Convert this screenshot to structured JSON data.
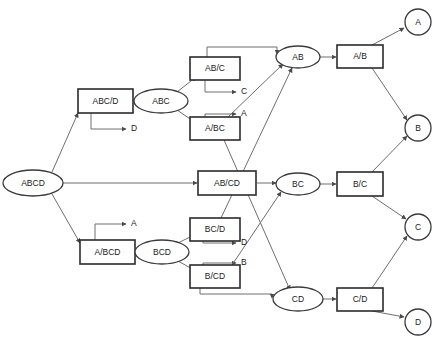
{
  "diagram": {
    "canvas": {
      "width": 442,
      "height": 341,
      "background": "#ffffff"
    },
    "colors": {
      "box_stroke": "#2b2b2b",
      "ellipse_stroke": "#3a3a3a",
      "circle_stroke": "#3a3a3a",
      "edge": "#6e6e6e",
      "text": "#1a1a1a",
      "fill": "#ffffff"
    },
    "nodes": {
      "root": {
        "label": "ABCD",
        "shape": "ellipse",
        "x": 33,
        "y": 183
      },
      "abc_d": {
        "label": "ABC/D",
        "shape": "box",
        "x": 105,
        "y": 101
      },
      "abc": {
        "label": "ABC",
        "shape": "ellipse",
        "x": 160,
        "y": 101
      },
      "ab_c": {
        "label": "AB/C",
        "shape": "box",
        "x": 215,
        "y": 69
      },
      "a_bc": {
        "label": "A/BC",
        "shape": "box",
        "x": 215,
        "y": 128
      },
      "ab": {
        "label": "AB",
        "shape": "ellipse",
        "x": 298,
        "y": 57
      },
      "a_b": {
        "label": "A/B",
        "shape": "box",
        "x": 360,
        "y": 56
      },
      "ab_cd": {
        "label": "AB/CD",
        "shape": "box",
        "x": 227,
        "y": 183
      },
      "bc": {
        "label": "BC",
        "shape": "ellipse",
        "x": 298,
        "y": 184
      },
      "b_c": {
        "label": "B/C",
        "shape": "box",
        "x": 360,
        "y": 184
      },
      "a_bcd": {
        "label": "A/BCD",
        "shape": "box",
        "x": 107,
        "y": 252
      },
      "bcd": {
        "label": "BCD",
        "shape": "ellipse",
        "x": 162,
        "y": 252
      },
      "bc_d": {
        "label": "BC/D",
        "shape": "box",
        "x": 215,
        "y": 229
      },
      "b_cd": {
        "label": "B/CD",
        "shape": "box",
        "x": 215,
        "y": 276
      },
      "cd": {
        "label": "CD",
        "shape": "ellipse",
        "x": 298,
        "y": 299
      },
      "c_d": {
        "label": "C/D",
        "shape": "box",
        "x": 360,
        "y": 299
      },
      "leaf_a": {
        "label": "A",
        "shape": "circle",
        "x": 418,
        "y": 22
      },
      "leaf_b": {
        "label": "B",
        "shape": "circle",
        "x": 418,
        "y": 128
      },
      "leaf_c": {
        "label": "C",
        "shape": "circle",
        "x": 418,
        "y": 227
      },
      "leaf_d": {
        "label": "D",
        "shape": "circle",
        "x": 418,
        "y": 322
      }
    },
    "output_labels": [
      {
        "id": "out-d-top",
        "text": "D",
        "x": 134,
        "y": 129
      },
      {
        "id": "out-c",
        "text": "C",
        "x": 244,
        "y": 92
      },
      {
        "id": "out-a-mid",
        "text": "A",
        "x": 244,
        "y": 114
      },
      {
        "id": "out-a-low",
        "text": "A",
        "x": 134,
        "y": 224
      },
      {
        "id": "out-d-low",
        "text": "D",
        "x": 244,
        "y": 243
      },
      {
        "id": "out-b-low",
        "text": "B",
        "x": 244,
        "y": 263
      }
    ],
    "edges": [
      {
        "from": "root",
        "to": "abc_d"
      },
      {
        "from": "root",
        "to": "ab_cd"
      },
      {
        "from": "root",
        "to": "a_bcd"
      },
      {
        "from": "abc_d",
        "to": "abc"
      },
      {
        "from": "abc_d",
        "to": "out-d-top"
      },
      {
        "from": "abc",
        "to": "ab_c"
      },
      {
        "from": "abc",
        "to": "a_bc"
      },
      {
        "from": "ab_c",
        "to": "ab"
      },
      {
        "from": "ab_c",
        "to": "out-c"
      },
      {
        "from": "a_bc",
        "to": "out-a-mid"
      },
      {
        "from": "a_bc",
        "to": "ab"
      },
      {
        "from": "a_bc",
        "to": "cd"
      },
      {
        "from": "ab",
        "to": "a_b"
      },
      {
        "from": "a_b",
        "to": "leaf_a"
      },
      {
        "from": "a_b",
        "to": "leaf_b"
      },
      {
        "from": "ab_cd",
        "to": "bc"
      },
      {
        "from": "bc",
        "to": "b_c"
      },
      {
        "from": "b_c",
        "to": "leaf_b"
      },
      {
        "from": "b_c",
        "to": "leaf_c"
      },
      {
        "from": "a_bcd",
        "to": "bcd"
      },
      {
        "from": "a_bcd",
        "to": "out-a-low"
      },
      {
        "from": "bcd",
        "to": "bc_d"
      },
      {
        "from": "bcd",
        "to": "b_cd"
      },
      {
        "from": "bc_d",
        "to": "out-d-low"
      },
      {
        "from": "bc_d",
        "to": "ab"
      },
      {
        "from": "b_cd",
        "to": "out-b-low"
      },
      {
        "from": "b_cd",
        "to": "bc"
      },
      {
        "from": "b_cd",
        "to": "cd"
      },
      {
        "from": "cd",
        "to": "c_d"
      },
      {
        "from": "c_d",
        "to": "leaf_c"
      },
      {
        "from": "c_d",
        "to": "leaf_d"
      }
    ]
  }
}
